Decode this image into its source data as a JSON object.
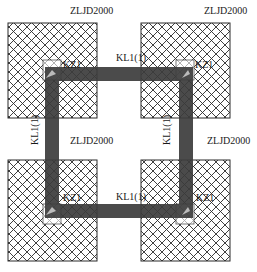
{
  "diagram": {
    "type": "structural-plan",
    "colors": {
      "hatch": "#2a2a2a",
      "beam": "#3c3c3c",
      "background": "#ffffff"
    },
    "foundations": [
      {
        "id": "tl",
        "label": "ZLJD2000"
      },
      {
        "id": "tr",
        "label": "ZLJD2000"
      },
      {
        "id": "bl",
        "label": "ZLJD2000"
      },
      {
        "id": "br",
        "label": "ZLJD2000"
      }
    ],
    "columns": [
      {
        "id": "tl",
        "label": "KZ1"
      },
      {
        "id": "tr",
        "label": "KZ1"
      },
      {
        "id": "bl",
        "label": "KZ1"
      },
      {
        "id": "br",
        "label": "KZ1"
      }
    ],
    "beams": [
      {
        "id": "top",
        "label": "KL1(1)"
      },
      {
        "id": "bottom",
        "label": "KL1(1)"
      },
      {
        "id": "left",
        "label": "KL1(1)"
      },
      {
        "id": "right",
        "label": "KL1(1)"
      }
    ]
  }
}
